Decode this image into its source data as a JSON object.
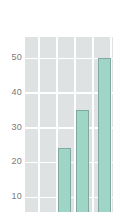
{
  "chart_data": {
    "type": "bar",
    "title": "",
    "subtitle": "",
    "xlabel": "",
    "ylabel": "",
    "categories": [
      "",
      "",
      ""
    ],
    "values": [
      24,
      35,
      50
    ],
    "ylim": [
      0,
      55
    ],
    "yticks": [
      10,
      20,
      30,
      40,
      50
    ],
    "ytick_labels": [
      "10",
      "20",
      "30",
      "40",
      "50"
    ],
    "xticks": [],
    "xtick_labels": [],
    "grid": true,
    "grid_axis": "both",
    "legend": false,
    "legend_position": "none",
    "annotations": [],
    "note": "bottom of plot is cropped by the screenshot frame",
    "colors": {
      "bar_fill": "#9fd5c5",
      "bar_edge": "#7fa9a1",
      "plot_background": "#dfe2e2",
      "grid_line": "#ffffff",
      "tick_label": "#7a7a7a",
      "figure_background": "#ffffff"
    }
  },
  "axis": {
    "y_ticks": [
      {
        "label": "50",
        "value": 50
      },
      {
        "label": "40",
        "value": 40
      },
      {
        "label": "30",
        "value": 30
      },
      {
        "label": "20",
        "value": 20
      },
      {
        "label": "10",
        "value": 10
      }
    ]
  },
  "bars": [
    {
      "label": "",
      "value": 24
    },
    {
      "label": "",
      "value": 35
    },
    {
      "label": "",
      "value": 50
    }
  ]
}
